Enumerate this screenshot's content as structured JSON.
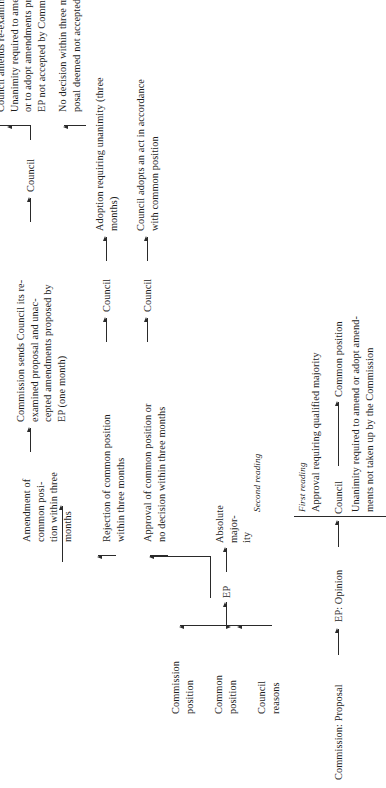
{
  "diagram": {
    "title_hidden": "EU cooperation procedure flow chart",
    "stage_labels": {
      "first_reading": "First reading",
      "second_reading": "Second reading"
    },
    "nodes": {
      "commission_proposal": "Commission: Proposal",
      "ep_opinion": "EP: Opinion",
      "council_1": "Council",
      "common_position": "Common position",
      "qualified_majority": "Approval requiring qualified majority",
      "unanimity_note": "Unanimity required to amend or adopt amend-\nments not taken up by the Commission",
      "council_reasons": "Council\nreasons",
      "common_position_small": "Common\nposition",
      "commission_position": "Commission\nposition",
      "ep": "EP",
      "absolute_majority": "Absolute major-\nity",
      "approval_or_no_decision": "Approval of common position or\nno decision within three months",
      "rejection": "Rejection of common position\nwithin three months",
      "amendment": "Amendment of\ncommon posi-\ntion within three\nmonths",
      "council_2": "Council",
      "council_3": "Council",
      "council_4": "Council",
      "commission_sends": "Commission sends Council its re-\nexamined proposal and unac-\ncepted amendments proposed by\nEP (one month)",
      "council_adopts": "Council adopts an act in accordance\nwith common position",
      "adoption_unanimity": "Adoption requiring unanimity (three\nmonths)",
      "reapproves": "Reapproves original common position\nwith qualified majority",
      "council_amends": "Council amends re-examined proposal.\nUnanimity required to amend proposal\nor to adopt amendments proposed by\nEP not accepted by Commission",
      "no_decision": "No decision within three months; pro-\nposal deemed not accepted."
    },
    "arrows": {
      "proposal_to_opinion": "arrow-right",
      "opinion_to_council": "arrow-right",
      "council_to_common_position": "arrow-right",
      "ep_to_absolute_majority": "arrow-right",
      "absolute_majority_to_branch": "arrow-right",
      "branch_to_approval": "arrow-right",
      "branch_to_rejection": "arrow-right",
      "approval_to_council2": "arrow-right",
      "rejection_to_council3": "arrow-right",
      "amendment_to_commission_sends": "arrow-right",
      "commission_sends_to_council4": "arrow-right",
      "council4_to_reapproves": "arrow-right",
      "council4_to_amends": "arrow-right",
      "council4_to_no_decision": "arrow-right",
      "council2_to_adopts": "arrow-right",
      "council3_to_adoption_unanimity": "arrow-right",
      "feedback_up": "arrow-up",
      "feedback_down": "arrow-down"
    },
    "colors": {
      "ink": "#1d1d1d",
      "line": "#2a2a2a",
      "paper": "#ffffff"
    }
  }
}
